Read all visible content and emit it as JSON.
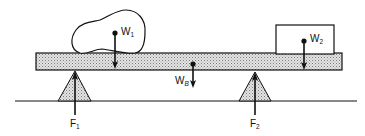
{
  "diagram": {
    "type": "static-equilibrium-beam",
    "colors": {
      "stroke": "#111111",
      "beam_fill": "#d9d9d9",
      "support_fill": "#d9d9d9",
      "background": "#ffffff"
    },
    "labels": {
      "w1": {
        "base": "W",
        "sub": "1"
      },
      "w2": {
        "base": "W",
        "sub": "2"
      },
      "wb": {
        "base": "W",
        "sub": "B"
      },
      "f1": {
        "base": "F",
        "sub": "1"
      },
      "f2": {
        "base": "F",
        "sub": "2"
      }
    },
    "elements": {
      "beam": "shaded plank",
      "object_1": "irregular rock on left side of beam",
      "object_2": "rectangular box on right end of beam",
      "support_1": "triangular fulcrum under left",
      "support_2": "triangular fulcrum under right",
      "ground": "horizontal line"
    }
  }
}
